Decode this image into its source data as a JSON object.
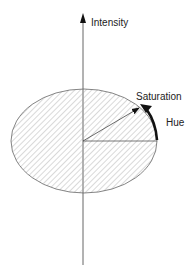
{
  "diagram": {
    "labels": {
      "intensity": "Intensity",
      "saturation": "Saturation",
      "hue": "Hue"
    },
    "colors": {
      "stroke": "#555555",
      "hatch": "#9a9a9a",
      "arrow": "#111111",
      "background": "#ffffff"
    }
  }
}
